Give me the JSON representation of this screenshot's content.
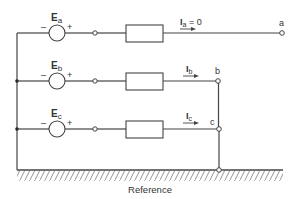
{
  "diagram": {
    "colors": {
      "line": "#444444",
      "text": "#333333",
      "hatch": "#888888",
      "background": "#ffffff"
    },
    "sources": [
      {
        "id": "a",
        "label": "E",
        "subscript": "a",
        "minus": "–",
        "plus": "+"
      },
      {
        "id": "b",
        "label": "E",
        "subscript": "b",
        "minus": "–",
        "plus": "+"
      },
      {
        "id": "c",
        "label": "E",
        "subscript": "c",
        "minus": "–",
        "plus": "+"
      }
    ],
    "currents": [
      {
        "id": "a",
        "label": "I",
        "subscript": "a",
        "suffix": " = 0"
      },
      {
        "id": "b",
        "label": "I",
        "subscript": "b",
        "suffix": ""
      },
      {
        "id": "c",
        "label": "I",
        "subscript": "c",
        "suffix": ""
      }
    ],
    "terminals": [
      {
        "id": "a",
        "label": "a"
      },
      {
        "id": "b",
        "label": "b"
      },
      {
        "id": "c",
        "label": "c"
      }
    ],
    "ground": {
      "label": "Reference"
    }
  }
}
